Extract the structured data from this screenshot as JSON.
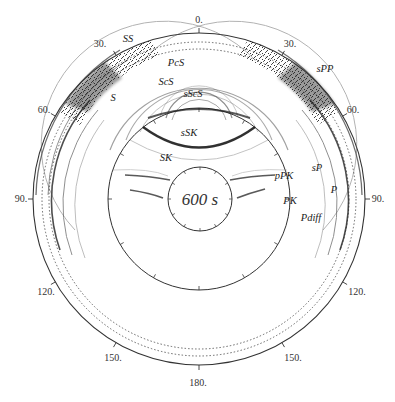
{
  "figure": {
    "time_label": "600 s",
    "distance_labels": [
      {
        "text": "0.",
        "x": 199,
        "y": 23
      },
      {
        "text": "30.",
        "x": 100,
        "y": 47
      },
      {
        "text": "30.",
        "x": 290,
        "y": 47
      },
      {
        "text": "60.",
        "x": 44,
        "y": 113
      },
      {
        "text": "60.",
        "x": 353,
        "y": 113
      },
      {
        "text": "90.",
        "x": 21,
        "y": 202
      },
      {
        "text": "90.",
        "x": 378,
        "y": 202
      },
      {
        "text": "120.",
        "x": 46,
        "y": 295
      },
      {
        "text": "120.",
        "x": 357,
        "y": 295
      },
      {
        "text": "150.",
        "x": 113,
        "y": 361
      },
      {
        "text": "150.",
        "x": 293,
        "y": 361
      },
      {
        "text": "180.",
        "x": 198,
        "y": 386
      }
    ],
    "phase_labels": [
      {
        "text": "SS",
        "x": 128,
        "y": 42
      },
      {
        "text": "PcS",
        "x": 176,
        "y": 66
      },
      {
        "text": "ScS",
        "x": 166,
        "y": 85
      },
      {
        "text": "S",
        "x": 113,
        "y": 101
      },
      {
        "text": "sScS",
        "x": 193,
        "y": 97
      },
      {
        "text": "sPP",
        "x": 325,
        "y": 72
      },
      {
        "text": "sSK",
        "x": 189,
        "y": 136
      },
      {
        "text": "SK",
        "x": 166,
        "y": 161
      },
      {
        "text": "pPK",
        "x": 284,
        "y": 179
      },
      {
        "text": "sP",
        "x": 317,
        "y": 171
      },
      {
        "text": "P",
        "x": 334,
        "y": 193
      },
      {
        "text": "PK",
        "x": 290,
        "y": 204
      },
      {
        "text": "Pdiff",
        "x": 311,
        "y": 221
      }
    ]
  },
  "colors": {
    "ink": "#222222",
    "grid": "#444444",
    "wave": "#333333"
  }
}
